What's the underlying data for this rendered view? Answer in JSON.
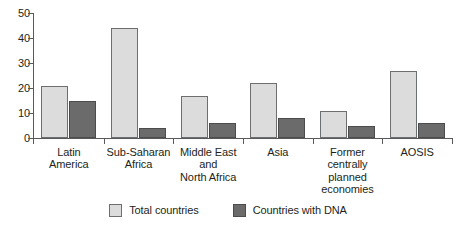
{
  "chart_data": {
    "type": "bar",
    "title": "",
    "subtitle": "",
    "xlabel": "",
    "ylabel": "",
    "ylim": [
      0,
      50
    ],
    "yticks": [
      0,
      10,
      20,
      30,
      40,
      50
    ],
    "grid": false,
    "legend_position": "bottom",
    "categories": [
      "Latin\nAmerica",
      "Sub-Saharan\nAfrica",
      "Middle East\nand\nNorth Africa",
      "Asia",
      "Former\ncentrally\nplanned\neconomies",
      "AOSIS"
    ],
    "category_lines": [
      [
        "Latin",
        "America"
      ],
      [
        "Sub-Saharan",
        "Africa"
      ],
      [
        "Middle East",
        "and",
        "North Africa"
      ],
      [
        "Asia"
      ],
      [
        "Former",
        "centrally",
        "planned",
        "economies"
      ],
      [
        "AOSIS"
      ]
    ],
    "series": [
      {
        "name": "Total countries",
        "color": "#dcdcdc",
        "values": [
          21,
          44,
          17,
          22,
          11,
          27
        ]
      },
      {
        "name": "Countries with DNA",
        "color": "#6b6b6b",
        "values": [
          15,
          4,
          6,
          8,
          5,
          6
        ]
      }
    ]
  },
  "legend": {
    "items": [
      {
        "label": "Total countries",
        "swatch": "total"
      },
      {
        "label": "Countries with DNA",
        "swatch": "dna"
      }
    ]
  },
  "axis": {
    "y_tick_labels": [
      "0",
      "10",
      "20",
      "30",
      "40",
      "50"
    ]
  }
}
